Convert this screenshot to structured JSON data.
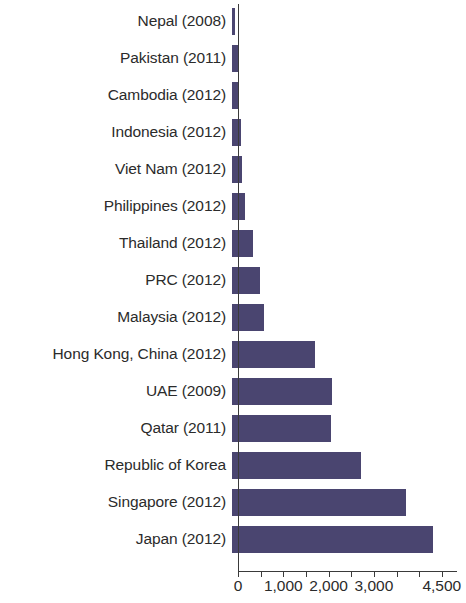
{
  "chart_data": {
    "type": "bar",
    "orientation": "horizontal",
    "title": "",
    "subtitle": "",
    "xlabel": "",
    "ylabel": "",
    "xlim": [
      0,
      4750
    ],
    "grid": false,
    "legend": null,
    "bar_color": "#4a4570",
    "axis_color": "#3a3a3a",
    "tick_values": [
      0,
      500,
      1000,
      1500,
      2000,
      2500,
      3000,
      3500,
      4000,
      4500
    ],
    "tick_labels": [
      {
        "value": 0,
        "text": "0"
      },
      {
        "value": 1000,
        "text": "1,000"
      },
      {
        "value": 2000,
        "text": "2,000"
      },
      {
        "value": 3000,
        "text": "3,000"
      },
      {
        "value": 4500,
        "text": "4,500"
      }
    ],
    "categories": [
      "Nepal (2008)",
      "Pakistan (2011)",
      "Cambodia (2012)",
      "Indonesia (2012)",
      "Viet Nam (2012)",
      "Philippines (2012)",
      "Thailand (2012)",
      "PRC (2012)",
      "Malaysia (2012)",
      "Hong Kong, China (2012)",
      "UAE (2009)",
      "Qatar (2011)",
      "Republic of Korea",
      "Singapore (2012)",
      "Japan (2012)"
    ],
    "values": [
      60,
      130,
      160,
      200,
      210,
      280,
      460,
      610,
      700,
      1840,
      2210,
      2190,
      2850,
      3840,
      4440
    ]
  }
}
